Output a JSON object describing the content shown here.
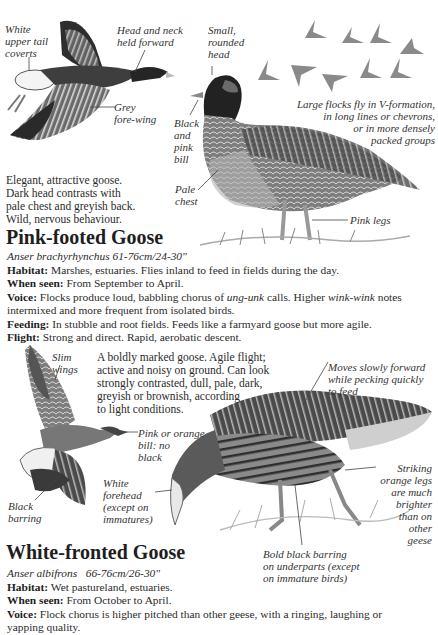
{
  "species": [
    {
      "name": "Pink-footed Goose",
      "scientific_name": "Anser brachyrhynchus",
      "size": "61-76cm/24-30\"",
      "description": [
        "Elegant, attractive goose.",
        "Dark head contrasts with",
        "pale chest and greyish back.",
        "Wild, nervous behaviour."
      ],
      "annotations": {
        "white_upper_tail": [
          "White",
          "upper tail",
          "coverts"
        ],
        "head_neck": [
          "Head and neck",
          "held forward"
        ],
        "grey_forewing": [
          "Grey",
          "fore-wing"
        ],
        "small_head": [
          "Small,",
          "rounded",
          "head"
        ],
        "bill": [
          "Black",
          "and",
          "pink",
          "bill"
        ],
        "pale_chest": [
          "Pale",
          "chest"
        ],
        "flocks": [
          "Large flocks fly in V-formation,",
          "in long lines or chevrons,",
          "or in more densely",
          "packed groups"
        ],
        "pink_legs": "Pink legs"
      },
      "facts": [
        {
          "label": "Habitat:",
          "text": "Marshes, estuaries. Flies inland to feed in fields during the day."
        },
        {
          "label": "When seen:",
          "text": "From September to April."
        },
        {
          "label": "Voice:",
          "text_1": "Flocks produce loud, babbling chorus of ",
          "em_1": "ung-unk",
          "text_2": " calls. Higher ",
          "em_2": "wink-wink",
          "text_3": " notes",
          "text_4": "intermixed and more frequent from isolated birds."
        },
        {
          "label": "Feeding:",
          "text": "In stubble and root fields. Feeds like a farmyard goose but more agile."
        },
        {
          "label": "Flight:",
          "text": "Strong and direct. Rapid, aerobatic descent."
        }
      ]
    },
    {
      "name": "White-fronted Goose",
      "scientific_name": "Anser albifrons",
      "size": "66-76cm/26-30\"",
      "description": [
        "A boldly marked goose. Agile flight;",
        "active and noisy on ground. Can look",
        "strongly contrasted, dull, pale, dark,",
        "greyish or brownish, according",
        "to light conditions."
      ],
      "annotations": {
        "slim_wings": [
          "Slim",
          "wings"
        ],
        "bill": [
          "Pink or orange",
          "bill: no",
          "black"
        ],
        "black_barring": [
          "Black",
          "barring"
        ],
        "white_forehead": [
          "White",
          "forehead",
          "(except on",
          "immatures)"
        ],
        "moves_slowly": [
          "Moves slowly forward",
          "while pecking quickly",
          "to feed"
        ],
        "orange_legs": [
          "Striking",
          "orange legs",
          "are much",
          "brighter",
          "than on",
          "other",
          "geese"
        ],
        "bold_barring": [
          "Bold black barring",
          "on underparts (except",
          "on immature birds)"
        ]
      },
      "facts": [
        {
          "label": "Habitat:",
          "text": "Wet pastureland, estuaries."
        },
        {
          "label": "When seen:",
          "text": "From October to April."
        },
        {
          "label": "Voice:",
          "text": "Flock chorus is higher pitched than other geese, with a ringing, laughing or",
          "text_2": "yapping quality."
        }
      ]
    }
  ]
}
